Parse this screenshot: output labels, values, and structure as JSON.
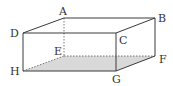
{
  "figure": {
    "type": "rectangular cuboid",
    "colors": {
      "edge": "#3a3a3a",
      "hidden_edge": "#555555",
      "shaded_face": "#d9d9d9",
      "label": "#333333"
    },
    "vertices": {
      "A": {
        "label": "A",
        "x": 64,
        "y": 18
      },
      "B": {
        "label": "B",
        "x": 155,
        "y": 18
      },
      "C": {
        "label": "C",
        "x": 116,
        "y": 33
      },
      "D": {
        "label": "D",
        "x": 23,
        "y": 33
      },
      "E": {
        "label": "E",
        "x": 64,
        "y": 56
      },
      "F": {
        "label": "F",
        "x": 155,
        "y": 56
      },
      "G": {
        "label": "G",
        "x": 116,
        "y": 71
      },
      "H": {
        "label": "H",
        "x": 23,
        "y": 71
      }
    },
    "shaded_face": [
      "H",
      "E",
      "F",
      "G"
    ],
    "visible_edges": [
      "DA",
      "AB",
      "BC",
      "CD",
      "DH",
      "CG",
      "BF",
      "HG",
      "GF"
    ],
    "hidden_edges": [
      "AE",
      "HE",
      "EF"
    ]
  }
}
